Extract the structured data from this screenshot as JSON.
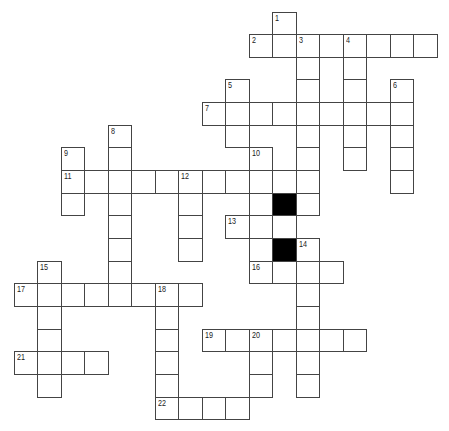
{
  "puzzle": {
    "type": "crossword",
    "grid": {
      "origin_x": 14,
      "origin_y": 12,
      "cell_width": 23.5,
      "cell_height": 22.65,
      "cols": 18,
      "rows": 18
    },
    "colors": {
      "cell_fill": "#ffffff",
      "cell_border": "#444444",
      "block_fill": "#000000"
    },
    "clue_numbers": [
      "1",
      "2",
      "3",
      "4",
      "5",
      "6",
      "7",
      "8",
      "9",
      "10",
      "11",
      "12",
      "13",
      "14",
      "15",
      "16",
      "17",
      "18",
      "19",
      "20",
      "21",
      "22"
    ],
    "cells": [
      {
        "c": 11,
        "r": 0,
        "n": "1"
      },
      {
        "c": 10,
        "r": 1,
        "n": "2"
      },
      {
        "c": 11,
        "r": 1
      },
      {
        "c": 12,
        "r": 1,
        "n": "3"
      },
      {
        "c": 13,
        "r": 1
      },
      {
        "c": 14,
        "r": 1,
        "n": "4"
      },
      {
        "c": 15,
        "r": 1
      },
      {
        "c": 16,
        "r": 1
      },
      {
        "c": 17,
        "r": 1
      },
      {
        "c": 12,
        "r": 2
      },
      {
        "c": 14,
        "r": 2
      },
      {
        "c": 9,
        "r": 3,
        "n": "5"
      },
      {
        "c": 12,
        "r": 3
      },
      {
        "c": 14,
        "r": 3
      },
      {
        "c": 16,
        "r": 3,
        "n": "6"
      },
      {
        "c": 8,
        "r": 4,
        "n": "7"
      },
      {
        "c": 9,
        "r": 4
      },
      {
        "c": 10,
        "r": 4
      },
      {
        "c": 11,
        "r": 4
      },
      {
        "c": 12,
        "r": 4
      },
      {
        "c": 13,
        "r": 4
      },
      {
        "c": 14,
        "r": 4
      },
      {
        "c": 15,
        "r": 4
      },
      {
        "c": 16,
        "r": 4
      },
      {
        "c": 4,
        "r": 5,
        "n": "8"
      },
      {
        "c": 9,
        "r": 5
      },
      {
        "c": 12,
        "r": 5
      },
      {
        "c": 14,
        "r": 5
      },
      {
        "c": 16,
        "r": 5
      },
      {
        "c": 2,
        "r": 6,
        "n": "9"
      },
      {
        "c": 4,
        "r": 6
      },
      {
        "c": 10,
        "r": 6,
        "n": "10"
      },
      {
        "c": 12,
        "r": 6
      },
      {
        "c": 14,
        "r": 6
      },
      {
        "c": 16,
        "r": 6
      },
      {
        "c": 2,
        "r": 7,
        "n": "11"
      },
      {
        "c": 3,
        "r": 7
      },
      {
        "c": 4,
        "r": 7
      },
      {
        "c": 5,
        "r": 7
      },
      {
        "c": 6,
        "r": 7
      },
      {
        "c": 7,
        "r": 7,
        "n": "12"
      },
      {
        "c": 8,
        "r": 7
      },
      {
        "c": 9,
        "r": 7
      },
      {
        "c": 10,
        "r": 7
      },
      {
        "c": 11,
        "r": 7
      },
      {
        "c": 12,
        "r": 7
      },
      {
        "c": 16,
        "r": 7
      },
      {
        "c": 2,
        "r": 8
      },
      {
        "c": 4,
        "r": 8
      },
      {
        "c": 7,
        "r": 8
      },
      {
        "c": 10,
        "r": 8
      },
      {
        "c": 11,
        "r": 8,
        "block": true
      },
      {
        "c": 12,
        "r": 8
      },
      {
        "c": 4,
        "r": 9
      },
      {
        "c": 7,
        "r": 9
      },
      {
        "c": 9,
        "r": 9,
        "n": "13"
      },
      {
        "c": 10,
        "r": 9
      },
      {
        "c": 11,
        "r": 9
      },
      {
        "c": 4,
        "r": 10
      },
      {
        "c": 7,
        "r": 10
      },
      {
        "c": 10,
        "r": 10
      },
      {
        "c": 11,
        "r": 10,
        "block": true
      },
      {
        "c": 12,
        "r": 10,
        "n": "14"
      },
      {
        "c": 1,
        "r": 11,
        "n": "15"
      },
      {
        "c": 4,
        "r": 11
      },
      {
        "c": 10,
        "r": 11,
        "n": "16"
      },
      {
        "c": 11,
        "r": 11
      },
      {
        "c": 12,
        "r": 11
      },
      {
        "c": 13,
        "r": 11
      },
      {
        "c": 0,
        "r": 12,
        "n": "17"
      },
      {
        "c": 1,
        "r": 12
      },
      {
        "c": 2,
        "r": 12
      },
      {
        "c": 3,
        "r": 12
      },
      {
        "c": 4,
        "r": 12
      },
      {
        "c": 5,
        "r": 12
      },
      {
        "c": 6,
        "r": 12,
        "n": "18"
      },
      {
        "c": 7,
        "r": 12
      },
      {
        "c": 12,
        "r": 12
      },
      {
        "c": 1,
        "r": 13
      },
      {
        "c": 6,
        "r": 13
      },
      {
        "c": 12,
        "r": 13
      },
      {
        "c": 1,
        "r": 14
      },
      {
        "c": 6,
        "r": 14
      },
      {
        "c": 8,
        "r": 14,
        "n": "19"
      },
      {
        "c": 9,
        "r": 14
      },
      {
        "c": 10,
        "r": 14,
        "n": "20"
      },
      {
        "c": 11,
        "r": 14
      },
      {
        "c": 12,
        "r": 14
      },
      {
        "c": 13,
        "r": 14
      },
      {
        "c": 14,
        "r": 14
      },
      {
        "c": 0,
        "r": 15,
        "n": "21"
      },
      {
        "c": 1,
        "r": 15
      },
      {
        "c": 2,
        "r": 15
      },
      {
        "c": 3,
        "r": 15
      },
      {
        "c": 6,
        "r": 15
      },
      {
        "c": 10,
        "r": 15
      },
      {
        "c": 12,
        "r": 15
      },
      {
        "c": 1,
        "r": 16
      },
      {
        "c": 6,
        "r": 16
      },
      {
        "c": 10,
        "r": 16
      },
      {
        "c": 12,
        "r": 16
      },
      {
        "c": 6,
        "r": 17,
        "n": "22"
      },
      {
        "c": 7,
        "r": 17
      },
      {
        "c": 8,
        "r": 17
      },
      {
        "c": 9,
        "r": 17
      }
    ]
  }
}
